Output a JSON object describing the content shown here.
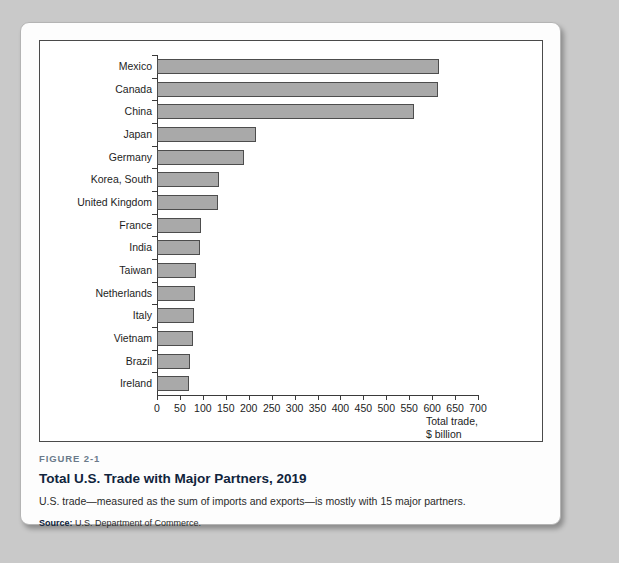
{
  "figure": {
    "number_label": "FIGURE 2-1",
    "title": "Total U.S. Trade with Major Partners, 2019",
    "description": "U.S. trade—measured as the sum of imports and exports—is mostly with 15 major partners.",
    "source_label": "Source:",
    "source_text": "U.S. Department of Commerce."
  },
  "axis": {
    "x_title_line1": "Total trade,",
    "x_title_line2": "$ billion"
  },
  "colors": {
    "bar_fill": "#a9a9a9",
    "bar_stroke": "#4d4d4d",
    "axis": "#3a3a3a",
    "page_background": "#c9c9c9",
    "card_background": "#fdfdfd",
    "title_text": "#10243c",
    "figure_number_text": "#6a7a8a"
  },
  "chart_data": {
    "type": "bar",
    "orientation": "horizontal",
    "title": "Total U.S. Trade with Major Partners, 2019",
    "xlabel": "Total trade, $ billion",
    "ylabel": "",
    "xlim": [
      0,
      700
    ],
    "xticks": [
      0,
      50,
      100,
      150,
      200,
      250,
      300,
      350,
      400,
      450,
      500,
      550,
      600,
      650,
      700
    ],
    "grid": false,
    "legend": null,
    "categories": [
      "Mexico",
      "Canada",
      "China",
      "Japan",
      "Germany",
      "Korea, South",
      "United Kingdom",
      "France",
      "India",
      "Taiwan",
      "Netherlands",
      "Italy",
      "Vietnam",
      "Brazil",
      "Ireland"
    ],
    "values": [
      614,
      612,
      560,
      215,
      190,
      135,
      133,
      96,
      93,
      86,
      82,
      81,
      78,
      73,
      70
    ]
  }
}
